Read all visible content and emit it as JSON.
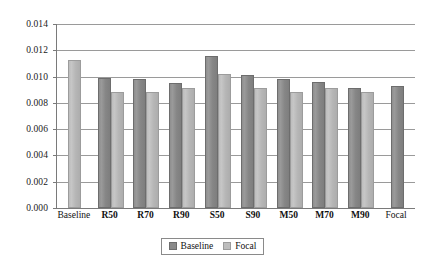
{
  "chart_data": {
    "type": "bar",
    "title": "",
    "subtitle": "",
    "xlabel": "",
    "ylabel": "",
    "ylim": [
      0.0,
      0.014
    ],
    "ytick_step": 0.002,
    "ytick_labels": [
      "0.014",
      "0.012",
      "0.010",
      "0.008",
      "0.006",
      "0.004",
      "0.002",
      "0.000"
    ],
    "ytick_values": [
      0.014,
      0.012,
      0.01,
      0.008,
      0.006,
      0.004,
      0.002,
      0.0
    ],
    "grid": true,
    "legend_position": "bottom-center",
    "categories": [
      "Baseline",
      "R50",
      "R70",
      "R90",
      "S50",
      "S90",
      "M50",
      "M70",
      "M90",
      "Focal"
    ],
    "categories_bold": [
      false,
      true,
      true,
      true,
      true,
      true,
      true,
      true,
      true,
      false
    ],
    "series": [
      {
        "name": "Baseline",
        "color": "#8a8a8a",
        "values": [
          null,
          0.0099,
          0.0098,
          0.0095,
          0.0116,
          0.0101,
          0.0098,
          0.0096,
          0.0091,
          0.0093
        ]
      },
      {
        "name": "Focal",
        "color": "#bdbdbd",
        "values": [
          0.0113,
          0.0088,
          0.0088,
          0.0091,
          0.0102,
          0.0091,
          0.0088,
          0.0091,
          0.0088,
          null
        ]
      }
    ],
    "legend": [
      {
        "label": "Baseline",
        "color": "#8a8a8a"
      },
      {
        "label": "Focal",
        "color": "#bdbdbd"
      }
    ]
  },
  "colors": {
    "baseline_bar": "#8a8a8a",
    "focal_bar": "#bdbdbd",
    "gridline": "#9a9a9a",
    "axis": "#7a7a7a",
    "background": "#ffffff",
    "text": "#111111"
  }
}
